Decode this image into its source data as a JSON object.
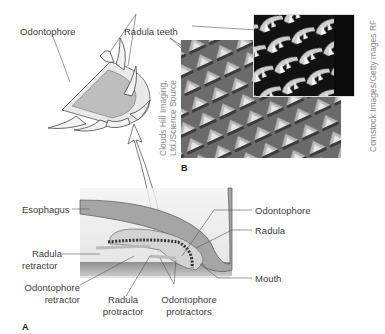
{
  "figure": {
    "panel_a": {
      "letter": "A",
      "labels": {
        "esophagus": "Esophagus",
        "radula_retractor_1": "Radula",
        "radula_retractor_2": "retractor",
        "odontophore_retractor_1": "Odontophore",
        "odontophore_retractor_2": "retractor",
        "radula_protractor_1": "Radula",
        "radula_protractor_2": "protractor",
        "odontophore_protractors_1": "Odontophore",
        "odontophore_protractors_2": "protractors",
        "odontophore": "Odontophore",
        "radula": "Radula",
        "mouth": "Mouth"
      }
    },
    "detail": {
      "odontophore": "Odontophore",
      "radula_teeth": "Radula teeth"
    },
    "panel_b": {
      "letter": "B",
      "credit_left_1": "Clouds Hill Imaging,",
      "credit_left_2": "Ltd./Science Source",
      "credit_right": "Comstock Images/Getty  mages RF"
    },
    "colors": {
      "line": "#444444",
      "tissue_dark": "#9a9a9a",
      "tissue_light": "#d6d6d6",
      "sem_bg": "#5a5a5a",
      "sem_inset_bg": "#0a0a0a"
    }
  }
}
